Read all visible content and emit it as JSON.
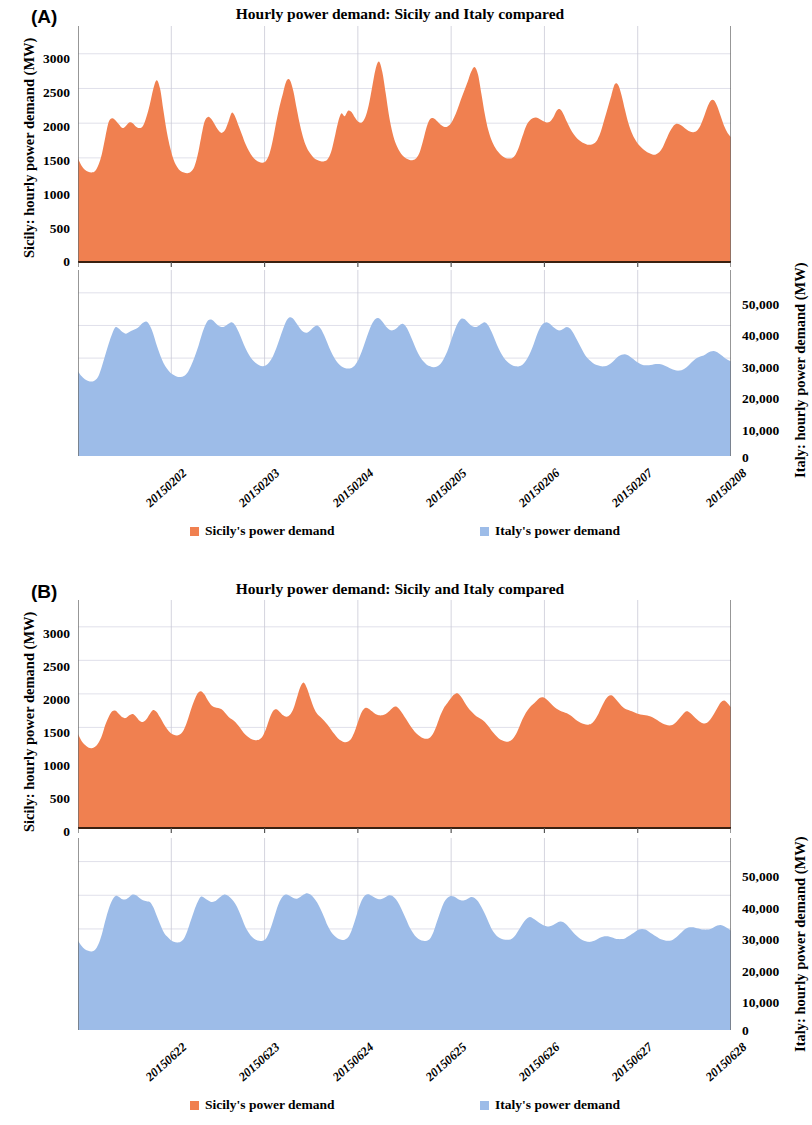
{
  "figure": {
    "background": "#ffffff",
    "series_colors": {
      "sicily": "#F08050",
      "italy": "#9DBCE8"
    }
  },
  "panels": [
    {
      "letter": "(A)",
      "title": "Hourly power demand: Sicily and Italy compared",
      "left_axis_title": "Sicily: hourly power demand (MW)",
      "right_axis_title": "Italy: hourly power demand (MW)",
      "left_ticks": [
        "3000",
        "2500",
        "2000",
        "1500",
        "1000",
        "500",
        "0"
      ],
      "right_ticks": [
        "50,000",
        "40,000",
        "30,000",
        "20,000",
        "10,000",
        "0"
      ],
      "x_ticks": [
        "20150202",
        "20150203",
        "20150204",
        "20150205",
        "20150206",
        "20150207",
        "20150208"
      ],
      "legend": [
        {
          "label": "Sicily's power demand",
          "color": "#F08050"
        },
        {
          "label": "Italy's power demand",
          "color": "#9DBCE8"
        }
      ]
    },
    {
      "letter": "(B)",
      "title": "Hourly power demand: Sicily and Italy compared",
      "left_axis_title": "Sicily: hourly power demand (MW)",
      "right_axis_title": "Italy: hourly power demand (MW)",
      "left_ticks": [
        "3000",
        "2500",
        "2000",
        "1500",
        "1000",
        "500",
        "0"
      ],
      "right_ticks": [
        "50,000",
        "40,000",
        "30,000",
        "20,000",
        "10,000",
        "0"
      ],
      "x_ticks": [
        "20150622",
        "20150623",
        "20150624",
        "20150625",
        "20150626",
        "20150627",
        "20150628"
      ],
      "legend": [
        {
          "label": "Sicily's power demand",
          "color": "#F08050"
        },
        {
          "label": "Italy's power demand",
          "color": "#9DBCE8"
        }
      ]
    }
  ],
  "chart_data": [
    {
      "panel": "A",
      "type": "area",
      "title": "Hourly power demand: Sicily and Italy compared",
      "subtitle": "Winter week, 2 February 2015 - 8 February 2015 (hourly)",
      "xlabel": "",
      "ylabel": "Sicily: hourly power demand (MW)",
      "y2label": "Italy: hourly power demand (MW)",
      "ylim": [
        0,
        3400
      ],
      "y2lim": [
        0,
        57000
      ],
      "yticks": [
        0,
        500,
        1000,
        1500,
        2000,
        2500,
        3000
      ],
      "y2ticks": [
        0,
        10000,
        20000,
        30000,
        40000,
        50000
      ],
      "grid": true,
      "legend_position": "bottom",
      "x": [
        "20150202",
        "20150203",
        "20150204",
        "20150205",
        "20150206",
        "20150207",
        "20150208"
      ],
      "x_tick_interval_hours": 24,
      "series": [
        {
          "name": "Sicily's power demand",
          "color": "#F08050",
          "axis": "left",
          "units": "MW",
          "values": [
            1490,
            1390,
            1330,
            1300,
            1290,
            1310,
            1400,
            1560,
            1800,
            2020,
            2070,
            2040,
            1980,
            1930,
            1960,
            2010,
            2000,
            1950,
            1930,
            1960,
            2090,
            2270,
            2490,
            2620,
            2500,
            2180,
            1870,
            1640,
            1470,
            1370,
            1310,
            1290,
            1280,
            1300,
            1370,
            1540,
            1790,
            2020,
            2090,
            2060,
            1980,
            1900,
            1860,
            1900,
            2020,
            2150,
            2090,
            1960,
            1830,
            1700,
            1600,
            1520,
            1470,
            1440,
            1430,
            1460,
            1560,
            1760,
            2020,
            2250,
            2440,
            2610,
            2620,
            2460,
            2200,
            1960,
            1770,
            1640,
            1560,
            1500,
            1470,
            1450,
            1450,
            1480,
            1580,
            1780,
            2000,
            2140,
            2100,
            2180,
            2160,
            2080,
            2020,
            2010,
            2080,
            2250,
            2510,
            2770,
            2890,
            2740,
            2430,
            2100,
            1860,
            1700,
            1600,
            1530,
            1490,
            1470,
            1470,
            1500,
            1590,
            1760,
            1950,
            2060,
            2070,
            2030,
            1980,
            1950,
            1950,
            1990,
            2080,
            2200,
            2340,
            2470,
            2600,
            2740,
            2810,
            2700,
            2420,
            2130,
            1900,
            1750,
            1650,
            1580,
            1530,
            1500,
            1490,
            1500,
            1550,
            1660,
            1810,
            1950,
            2030,
            2070,
            2080,
            2060,
            2030,
            2010,
            2020,
            2080,
            2180,
            2200,
            2130,
            2020,
            1920,
            1840,
            1780,
            1740,
            1710,
            1690,
            1690,
            1710,
            1770,
            1890,
            2060,
            2230,
            2400,
            2560,
            2550,
            2400,
            2190,
            2000,
            1860,
            1760,
            1690,
            1640,
            1600,
            1570,
            1550,
            1550,
            1580,
            1650,
            1760,
            1870,
            1950,
            1990,
            1980,
            1950,
            1910,
            1880,
            1870,
            1890,
            1960,
            2080,
            2220,
            2320,
            2330,
            2240,
            2100,
            1960,
            1860,
            1800
          ]
        },
        {
          "name": "Italy's power demand",
          "color": "#9DBCE8",
          "axis": "right",
          "units": "MW",
          "values": [
            26000,
            24500,
            23500,
            23000,
            22800,
            23200,
            24500,
            27500,
            31000,
            34500,
            37500,
            39500,
            39000,
            38000,
            37500,
            38000,
            38500,
            39000,
            39800,
            40800,
            41200,
            40000,
            37500,
            34000,
            31000,
            28500,
            26800,
            25500,
            24800,
            24300,
            24200,
            24500,
            25500,
            27500,
            30000,
            33000,
            36500,
            39500,
            41500,
            41800,
            41000,
            40000,
            39500,
            39800,
            40500,
            41000,
            40000,
            38000,
            35500,
            33000,
            31000,
            29500,
            28500,
            27800,
            27500,
            27800,
            28800,
            30500,
            33000,
            36000,
            39000,
            41500,
            42500,
            42000,
            40500,
            39000,
            38000,
            37800,
            38500,
            39500,
            40000,
            39000,
            37000,
            34500,
            32000,
            30000,
            28500,
            27500,
            27000,
            26800,
            27000,
            27800,
            29500,
            32000,
            35000,
            38000,
            40500,
            42000,
            42200,
            41200,
            39800,
            38800,
            38500,
            39000,
            40000,
            40500,
            39500,
            37500,
            35000,
            32500,
            30500,
            29000,
            28000,
            27500,
            27200,
            27400,
            28200,
            29800,
            32000,
            35000,
            38000,
            40500,
            42000,
            42000,
            41000,
            40000,
            39500,
            39800,
            40500,
            41000,
            40000,
            38000,
            35500,
            33000,
            31000,
            29500,
            28500,
            27800,
            27500,
            27500,
            28000,
            29200,
            31000,
            33500,
            36500,
            39000,
            40500,
            41000,
            40500,
            39500,
            38800,
            38500,
            39000,
            39500,
            39000,
            37500,
            35500,
            33500,
            31500,
            30000,
            29000,
            28200,
            27800,
            27500,
            27500,
            27800,
            28500,
            29500,
            30500,
            31000,
            31200,
            30800,
            30000,
            29200,
            28500,
            28000,
            27800,
            27800,
            28000,
            28200,
            28200,
            28000,
            27500,
            27000,
            26500,
            26200,
            26200,
            26500,
            27200,
            28200,
            29200,
            30000,
            30500,
            30800,
            31500,
            32000,
            32200,
            31800,
            31000,
            30200,
            29500,
            29000
          ]
        }
      ]
    },
    {
      "panel": "B",
      "type": "area",
      "title": "Hourly power demand: Sicily and Italy compared",
      "subtitle": "Summer week, 22 June 2015 - 28 June 2015 (hourly)",
      "xlabel": "",
      "ylabel": "Sicily: hourly power demand (MW)",
      "y2label": "Italy: hourly power demand (MW)",
      "ylim": [
        0,
        3400
      ],
      "y2lim": [
        0,
        57000
      ],
      "yticks": [
        0,
        500,
        1000,
        1500,
        2000,
        2500,
        3000
      ],
      "y2ticks": [
        0,
        10000,
        20000,
        30000,
        40000,
        50000
      ],
      "grid": true,
      "legend_position": "bottom",
      "x": [
        "20150622",
        "20150623",
        "20150624",
        "20150625",
        "20150626",
        "20150627",
        "20150628"
      ],
      "x_tick_interval_hours": 24,
      "series": [
        {
          "name": "Sicily's power demand",
          "color": "#F08050",
          "axis": "left",
          "units": "MW",
          "values": [
            1400,
            1300,
            1240,
            1200,
            1190,
            1210,
            1270,
            1380,
            1540,
            1660,
            1740,
            1750,
            1700,
            1650,
            1640,
            1680,
            1700,
            1660,
            1600,
            1580,
            1620,
            1700,
            1760,
            1730,
            1650,
            1560,
            1480,
            1420,
            1390,
            1380,
            1400,
            1470,
            1600,
            1760,
            1900,
            2010,
            2040,
            1990,
            1900,
            1830,
            1800,
            1790,
            1770,
            1720,
            1660,
            1620,
            1580,
            1520,
            1450,
            1390,
            1350,
            1320,
            1310,
            1320,
            1370,
            1480,
            1630,
            1740,
            1770,
            1730,
            1680,
            1660,
            1690,
            1780,
            1940,
            2100,
            2170,
            2080,
            1930,
            1790,
            1700,
            1650,
            1600,
            1540,
            1470,
            1400,
            1340,
            1300,
            1280,
            1290,
            1340,
            1450,
            1600,
            1730,
            1790,
            1780,
            1740,
            1700,
            1680,
            1680,
            1700,
            1740,
            1790,
            1810,
            1770,
            1700,
            1620,
            1540,
            1470,
            1410,
            1370,
            1340,
            1330,
            1350,
            1420,
            1540,
            1680,
            1790,
            1860,
            1930,
            1990,
            2010,
            1960,
            1880,
            1800,
            1740,
            1690,
            1650,
            1620,
            1580,
            1520,
            1450,
            1390,
            1340,
            1310,
            1290,
            1290,
            1320,
            1390,
            1500,
            1620,
            1720,
            1790,
            1840,
            1890,
            1940,
            1950,
            1920,
            1870,
            1820,
            1780,
            1750,
            1730,
            1710,
            1680,
            1640,
            1600,
            1570,
            1550,
            1540,
            1550,
            1600,
            1680,
            1790,
            1890,
            1960,
            1980,
            1940,
            1880,
            1820,
            1780,
            1760,
            1740,
            1720,
            1700,
            1690,
            1680,
            1670,
            1650,
            1620,
            1590,
            1560,
            1540,
            1530,
            1540,
            1580,
            1640,
            1700,
            1740,
            1720,
            1670,
            1620,
            1580,
            1560,
            1570,
            1620,
            1700,
            1790,
            1870,
            1900,
            1860,
            1800
          ]
        },
        {
          "name": "Italy's power demand",
          "color": "#9DBCE8",
          "axis": "right",
          "units": "MW",
          "values": [
            26500,
            25000,
            24000,
            23500,
            23300,
            23800,
            25500,
            28500,
            32500,
            36000,
            38500,
            39800,
            39500,
            38800,
            38800,
            39500,
            40200,
            40000,
            39200,
            38500,
            38200,
            38000,
            36500,
            34000,
            31500,
            29200,
            27800,
            26800,
            26200,
            26000,
            26200,
            27200,
            29500,
            32500,
            35500,
            38000,
            39600,
            39200,
            38500,
            38000,
            38200,
            39000,
            39800,
            40200,
            39800,
            38800,
            37500,
            35500,
            33000,
            30500,
            28800,
            27500,
            26800,
            26500,
            26500,
            27200,
            29200,
            32200,
            35500,
            38200,
            39800,
            40200,
            39800,
            39200,
            39000,
            39500,
            40200,
            40600,
            40200,
            39200,
            37800,
            35800,
            33500,
            31000,
            29200,
            28000,
            27200,
            26800,
            26800,
            27500,
            29500,
            32500,
            35800,
            38500,
            40000,
            40300,
            39800,
            39200,
            38800,
            39000,
            39500,
            40000,
            39800,
            38800,
            37200,
            35000,
            32800,
            30500,
            28800,
            27500,
            26800,
            26500,
            26500,
            27200,
            29200,
            32200,
            35200,
            37800,
            39200,
            39800,
            39600,
            39000,
            38500,
            38500,
            39000,
            39500,
            39200,
            38200,
            36500,
            34500,
            32200,
            30000,
            28500,
            27500,
            27000,
            26800,
            26800,
            27200,
            28200,
            29800,
            31500,
            32800,
            33500,
            33200,
            32500,
            31800,
            31200,
            30800,
            30800,
            31200,
            31800,
            32200,
            32000,
            31200,
            30000,
            28800,
            27800,
            27000,
            26500,
            26200,
            26200,
            26500,
            27000,
            27500,
            27800,
            27800,
            27500,
            27200,
            27000,
            27000,
            27200,
            27800,
            28500,
            29200,
            29800,
            30000,
            29800,
            29200,
            28500,
            27800,
            27200,
            26800,
            26500,
            26500,
            26800,
            27500,
            28500,
            29500,
            30200,
            30500,
            30500,
            30200,
            30000,
            29800,
            29800,
            30000,
            30500,
            31000,
            31200,
            30800,
            30200,
            29500
          ]
        }
      ]
    }
  ]
}
